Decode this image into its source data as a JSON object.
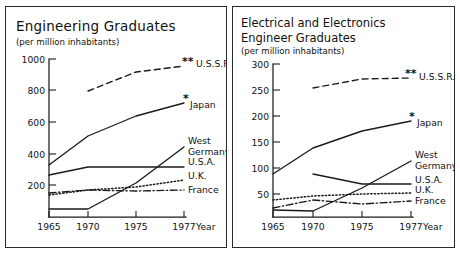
{
  "figure": {
    "panels": [
      {
        "id": "engineering-graduates",
        "title": "Engineering  Graduates",
        "title_line2": "",
        "subtitle": "(per million inhabitants)",
        "x_axis_caption": "Year"
      },
      {
        "id": "electrical-electronics-engineer-graduates",
        "title": "Electrical and  Electronics",
        "title_line2": "Engineer  Graduates",
        "subtitle": "(per million inhabitants)",
        "x_axis_caption": "Year"
      }
    ],
    "marker_notes": {
      "single_star": "*",
      "double_star": "**"
    }
  },
  "chart_data": [
    {
      "type": "line",
      "title": "Engineering  Graduates",
      "subtitle": "(per million inhabitants)",
      "xlabel": "Year",
      "ylabel": "(per million inhabitants)",
      "x": [
        1965,
        1970,
        1975,
        1977
      ],
      "xtick_labels": [
        "1965",
        "1970",
        "1975",
        "1977"
      ],
      "ytick_labels": [
        "200",
        "400",
        "600",
        "800",
        "1000"
      ],
      "yticks": [
        200,
        400,
        600,
        800,
        1000
      ],
      "ylim": [
        0,
        1060
      ],
      "xlim": [
        1965,
        1977
      ],
      "grid": false,
      "legend": "right-of-line-ends",
      "series": [
        {
          "name": "U.S.S.R.",
          "label": "U.S.S.R.",
          "marker": "**",
          "style": "dashed",
          "x": [
            1970,
            1975,
            1977
          ],
          "values": [
            825,
            945,
            985
          ]
        },
        {
          "name": "Japan",
          "label": "Japan",
          "marker": "*",
          "style": "solid",
          "x": [
            1965,
            1970,
            1975,
            1977
          ],
          "values": [
            330,
            510,
            640,
            725
          ]
        },
        {
          "name": "West Germany",
          "label": "West Germany",
          "marker": "",
          "style": "solid",
          "x": [
            1965,
            1970,
            1975,
            1977
          ],
          "values": [
            50,
            50,
            215,
            440
          ]
        },
        {
          "name": "U.S.A.",
          "label": "U.S.A.",
          "marker": "",
          "style": "solid",
          "x": [
            1965,
            1970,
            1975,
            1977
          ],
          "values": [
            260,
            310,
            310,
            310
          ]
        },
        {
          "name": "U.K.",
          "label": "U.K.",
          "marker": "",
          "style": "dotted",
          "x": [
            1965,
            1970,
            1975,
            1977
          ],
          "values": [
            140,
            170,
            190,
            235
          ]
        },
        {
          "name": "France",
          "label": "France",
          "marker": "",
          "style": "dash-dot",
          "x": [
            1965,
            1970,
            1975,
            1977
          ],
          "values": [
            150,
            170,
            165,
            170
          ]
        }
      ]
    },
    {
      "type": "line",
      "title": "Electrical and  Electronics Engineer  Graduates",
      "subtitle": "(per million inhabitants)",
      "xlabel": "Year",
      "ylabel": "(per million inhabitants)",
      "x": [
        1965,
        1970,
        1975,
        1977
      ],
      "xtick_labels": [
        "1965",
        "1970",
        "1975",
        "1977"
      ],
      "ytick_labels": [
        "50",
        "100",
        "150",
        "200",
        "250",
        "300"
      ],
      "yticks": [
        50,
        100,
        150,
        200,
        250,
        300
      ],
      "ylim": [
        0,
        318
      ],
      "xlim": [
        1965,
        1977
      ],
      "grid": false,
      "legend": "right-of-line-ends",
      "series": [
        {
          "name": "U.S.S.R.",
          "label": "U.S.S.R.",
          "marker": "**",
          "style": "dashed",
          "x": [
            1970,
            1975,
            1977
          ],
          "values": [
            248,
            266,
            268
          ]
        },
        {
          "name": "Japan",
          "label": "Japan",
          "marker": "*",
          "style": "solid",
          "x": [
            1965,
            1970,
            1975,
            1977
          ],
          "values": [
            83,
            133,
            165,
            184
          ]
        },
        {
          "name": "West Germany",
          "label": "West Germany",
          "marker": "",
          "style": "solid",
          "x": [
            1965,
            1970,
            1975,
            1977
          ],
          "values": [
            14,
            12,
            55,
            107
          ]
        },
        {
          "name": "U.S.A.",
          "label": "U.S.A.",
          "marker": "",
          "style": "solid",
          "x": [
            1970,
            1975,
            1977
          ],
          "values": [
            82,
            64,
            63
          ]
        },
        {
          "name": "U.K.",
          "label": "U.K.",
          "marker": "",
          "style": "dotted",
          "x": [
            1965,
            1970,
            1975,
            1977
          ],
          "values": [
            33,
            40,
            44,
            46
          ]
        },
        {
          "name": "France",
          "label": "France",
          "marker": "",
          "style": "dash-dot",
          "x": [
            1965,
            1970,
            1975,
            1977
          ],
          "values": [
            18,
            32,
            24,
            31
          ]
        }
      ]
    }
  ]
}
